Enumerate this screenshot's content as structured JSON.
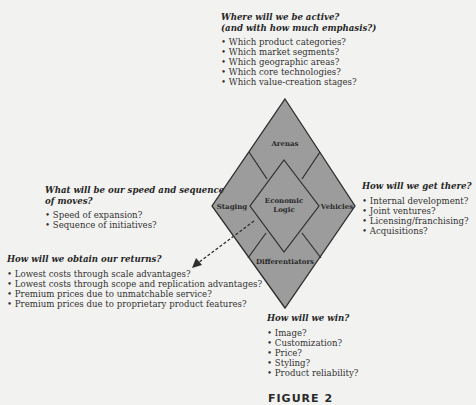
{
  "arenas": {
    "question_line1": "Where will we be active?",
    "question_line2": "(and with how much emphasis?)",
    "items": [
      "Which product categories?",
      "Which market segments?",
      "Which geographic areas?",
      "Which core technologies?",
      "Which value-creation stages?"
    ]
  },
  "staging": {
    "question_line1": "What will be our speed and sequence",
    "question_line2": "of moves?",
    "items": [
      "Speed of expansion?",
      "Sequence of initiatives?"
    ]
  },
  "vehicles": {
    "question": "How will we get there?",
    "items": [
      "Internal development?",
      "Joint ventures?",
      "Licensing/franchising?",
      "Acquisitions?"
    ]
  },
  "economic_logic": {
    "question": "How will we obtain our returns?",
    "items": [
      "Lowest costs through scale advantages?",
      "Lowest costs through scope and replication advantages?",
      "Premium prices due to unmatchable service?",
      "Premium prices due to proprietary product features?"
    ]
  },
  "differentiators": {
    "question": "How will we win?",
    "items": [
      "Image?",
      "Customization?",
      "Price?",
      "Styling?",
      "Product reliability?"
    ]
  },
  "diamond": {
    "labels": {
      "arenas": "Arenas",
      "staging": "Staging",
      "vehicles": "Vehicles",
      "differentiators": "Differentiators",
      "center_line1": "Economic",
      "center_line2": "Logic"
    },
    "colors": {
      "fill": "#9c9c9c",
      "stroke": "#2e2e2e",
      "background": "#f2f2f0"
    }
  },
  "figure_label": "FIGURE 2"
}
